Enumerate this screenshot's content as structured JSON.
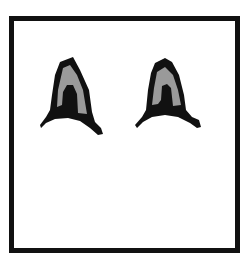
{
  "figure": {
    "colors": {
      "outline": "#111111",
      "inner_fill": "#9a9a9a",
      "background": "#ffffff"
    },
    "ears": [
      {
        "name": "left-ear"
      },
      {
        "name": "right-ear"
      }
    ]
  }
}
